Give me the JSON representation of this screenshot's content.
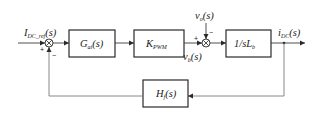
{
  "diagram": {
    "type": "control-block-diagram",
    "input": {
      "main": "I",
      "sub": "DC_ref",
      "arg": "(s)"
    },
    "output": {
      "main": "i",
      "sub": "DC",
      "arg": "(s)"
    },
    "blocks": {
      "controller": {
        "main": "G",
        "sub": "ai",
        "arg": "(s)"
      },
      "pwm": {
        "main": "K",
        "sub": "PWM",
        "arg": ""
      },
      "plant": {
        "main": "1/sL",
        "sub": "b",
        "arg": ""
      },
      "feedback": {
        "main": "H",
        "sub": "f",
        "arg": "(s)"
      }
    },
    "disturbance": {
      "main": "v",
      "sub": "o",
      "arg": "(s)"
    },
    "intermediate": {
      "main": "v",
      "sub": "b",
      "arg": "(s)"
    },
    "summing_junctions": {
      "sj1": {
        "plus": "+",
        "minus": "−"
      },
      "sj2": {
        "plus": "+",
        "minus": "−"
      }
    }
  }
}
